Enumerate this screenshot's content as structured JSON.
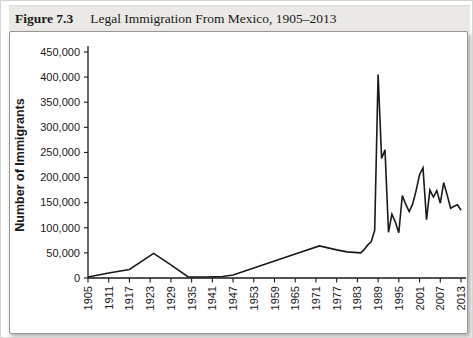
{
  "figure": {
    "label": "Figure 7.3",
    "title": "Legal Immigration From Mexico, 1905–2013"
  },
  "chart_data": {
    "type": "line",
    "title": "Legal Immigration From Mexico, 1905–2013",
    "xlabel": "",
    "ylabel": "Number of Immigrants",
    "xlim": [
      1905,
      2013
    ],
    "ylim": [
      0,
      450000
    ],
    "y_tick_interval": 50000,
    "y_ticks": [
      "0",
      "50,000",
      "100,000",
      "150,000",
      "200,000",
      "250,000",
      "300,000",
      "350,000",
      "400,000",
      "450,000"
    ],
    "x_ticks": [
      1905,
      1911,
      1917,
      1923,
      1929,
      1935,
      1941,
      1947,
      1953,
      1959,
      1965,
      1971,
      1977,
      1983,
      1989,
      1995,
      2001,
      2007,
      2013
    ],
    "grid": false,
    "legend": "none",
    "line_color": "#1a1a1a",
    "series": [
      {
        "name": "Legal immigrants from Mexico",
        "points": [
          [
            1905,
            2000
          ],
          [
            1911,
            10000
          ],
          [
            1917,
            17000
          ],
          [
            1924,
            49000
          ],
          [
            1929,
            26000
          ],
          [
            1934,
            2000
          ],
          [
            1939,
            2000
          ],
          [
            1944,
            3000
          ],
          [
            1947,
            6000
          ],
          [
            1953,
            20000
          ],
          [
            1959,
            34000
          ],
          [
            1965,
            48000
          ],
          [
            1972,
            64000
          ],
          [
            1977,
            56000
          ],
          [
            1980,
            52000
          ],
          [
            1984,
            50000
          ],
          [
            1985,
            57000
          ],
          [
            1986,
            66000
          ],
          [
            1987,
            72000
          ],
          [
            1988,
            95000
          ],
          [
            1989,
            405000
          ],
          [
            1990,
            238000
          ],
          [
            1991,
            255000
          ],
          [
            1992,
            91000
          ],
          [
            1993,
            127000
          ],
          [
            1994,
            111000
          ],
          [
            1995,
            90000
          ],
          [
            1996,
            164000
          ],
          [
            1997,
            147000
          ],
          [
            1998,
            132000
          ],
          [
            1999,
            147000
          ],
          [
            2000,
            174000
          ],
          [
            2001,
            206000
          ],
          [
            2002,
            219000
          ],
          [
            2003,
            116000
          ],
          [
            2004,
            175000
          ],
          [
            2005,
            161000
          ],
          [
            2006,
            174000
          ],
          [
            2007,
            149000
          ],
          [
            2008,
            190000
          ],
          [
            2009,
            165000
          ],
          [
            2010,
            139000
          ],
          [
            2011,
            143000
          ],
          [
            2012,
            146000
          ],
          [
            2013,
            135000
          ]
        ]
      }
    ]
  }
}
